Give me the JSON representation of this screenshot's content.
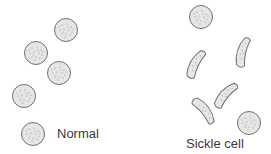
{
  "panels": [
    {
      "label": "Normal",
      "cell_type": "round",
      "cell_count": 5
    },
    {
      "label": "Sickle cell",
      "cell_type": "mixed",
      "round_count": 2,
      "sickle_count": 4
    }
  ],
  "colors": {
    "cell_fill": "#e6e6e6",
    "cell_stroke": "#707070",
    "speckle": "#8a8a8a",
    "text": "#3a3a3a"
  }
}
